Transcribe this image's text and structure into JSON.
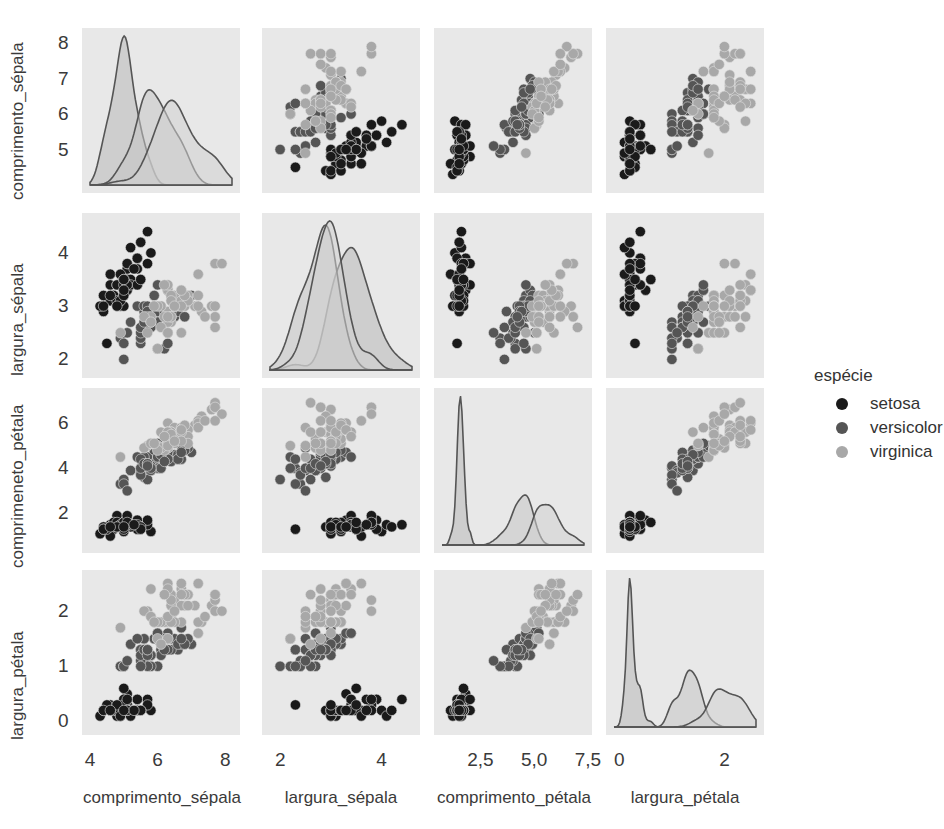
{
  "chart_data": {
    "type": "scatter",
    "kind": "pairplot",
    "title": "",
    "variables": [
      "comprimento_sépala",
      "largura_sépala",
      "comprimeneto_pétala",
      "largura_pétala"
    ],
    "x_axis_labels": [
      "comprimento_sépala",
      "largura_sépala",
      "comprimento_pétala",
      "largura_pétala"
    ],
    "y_axis_labels": [
      "comprimento_sépala",
      "largura_sépala",
      "comprimeneto_pétala",
      "largura_pétala"
    ],
    "diagonal": "kde",
    "offdiagonal": "scatter",
    "hue": "espécie",
    "legend": {
      "title": "espécie",
      "position": "right",
      "entries": [
        {
          "label": "setosa",
          "color": "#1a1a1a"
        },
        {
          "label": "versicolor",
          "color": "#555555"
        },
        {
          "label": "virginica",
          "color": "#a8a8a8"
        }
      ]
    },
    "ranges": {
      "comprimento_sépala": [
        4.0,
        8.2
      ],
      "largura_sépala": [
        1.8,
        4.6
      ],
      "comprimeneto_pétala": [
        0.6,
        7.2
      ],
      "largura_pétala": [
        -0.1,
        2.6
      ]
    },
    "y_ticks": [
      {
        "values": [
          5,
          6,
          7,
          8
        ],
        "labels": [
          "5",
          "6",
          "7",
          "8"
        ]
      },
      {
        "values": [
          2,
          3,
          4
        ],
        "labels": [
          "2",
          "3",
          "4"
        ]
      },
      {
        "values": [
          2,
          4,
          6
        ],
        "labels": [
          "2",
          "4",
          "6"
        ]
      },
      {
        "values": [
          0,
          1,
          2
        ],
        "labels": [
          "0",
          "1",
          "2"
        ]
      }
    ],
    "x_ticks": [
      {
        "values": [
          4,
          6,
          8
        ],
        "labels": [
          "4",
          "6",
          "8"
        ]
      },
      {
        "values": [
          2,
          4
        ],
        "labels": [
          "2",
          "4"
        ]
      },
      {
        "values": [
          2.5,
          5.0,
          7.5
        ],
        "labels": [
          "2,5",
          "5,0",
          "7,5"
        ]
      },
      {
        "values": [
          0,
          2
        ],
        "labels": [
          "0",
          "2"
        ]
      }
    ],
    "grid": false,
    "panel_background": "#e8e8e8",
    "series": [
      {
        "name": "setosa",
        "color": "#1a1a1a",
        "points": [
          [
            5.1,
            3.5,
            1.4,
            0.2
          ],
          [
            4.9,
            3.0,
            1.4,
            0.2
          ],
          [
            4.7,
            3.2,
            1.3,
            0.2
          ],
          [
            4.6,
            3.1,
            1.5,
            0.2
          ],
          [
            5.0,
            3.6,
            1.4,
            0.2
          ],
          [
            5.4,
            3.9,
            1.7,
            0.4
          ],
          [
            4.6,
            3.4,
            1.4,
            0.3
          ],
          [
            5.0,
            3.4,
            1.5,
            0.2
          ],
          [
            4.4,
            2.9,
            1.4,
            0.2
          ],
          [
            4.9,
            3.1,
            1.5,
            0.1
          ],
          [
            5.4,
            3.7,
            1.5,
            0.2
          ],
          [
            4.8,
            3.4,
            1.6,
            0.2
          ],
          [
            4.8,
            3.0,
            1.4,
            0.1
          ],
          [
            4.3,
            3.0,
            1.1,
            0.1
          ],
          [
            5.8,
            4.0,
            1.2,
            0.2
          ],
          [
            5.7,
            4.4,
            1.5,
            0.4
          ],
          [
            5.4,
            3.9,
            1.3,
            0.4
          ],
          [
            5.1,
            3.5,
            1.4,
            0.3
          ],
          [
            5.7,
            3.8,
            1.7,
            0.3
          ],
          [
            5.1,
            3.8,
            1.5,
            0.3
          ],
          [
            5.4,
            3.4,
            1.7,
            0.2
          ],
          [
            5.1,
            3.7,
            1.5,
            0.4
          ],
          [
            4.6,
            3.6,
            1.0,
            0.2
          ],
          [
            5.1,
            3.3,
            1.7,
            0.5
          ],
          [
            4.8,
            3.4,
            1.9,
            0.2
          ],
          [
            5.0,
            3.0,
            1.6,
            0.2
          ],
          [
            5.0,
            3.4,
            1.6,
            0.4
          ],
          [
            5.2,
            3.5,
            1.5,
            0.2
          ],
          [
            5.2,
            3.4,
            1.4,
            0.2
          ],
          [
            4.7,
            3.2,
            1.6,
            0.2
          ],
          [
            4.8,
            3.1,
            1.6,
            0.2
          ],
          [
            5.4,
            3.4,
            1.5,
            0.4
          ],
          [
            5.2,
            4.1,
            1.5,
            0.1
          ],
          [
            5.5,
            4.2,
            1.4,
            0.2
          ],
          [
            4.9,
            3.1,
            1.5,
            0.2
          ],
          [
            5.0,
            3.2,
            1.2,
            0.2
          ],
          [
            5.5,
            3.5,
            1.3,
            0.2
          ],
          [
            4.9,
            3.6,
            1.4,
            0.1
          ],
          [
            4.4,
            3.0,
            1.3,
            0.2
          ],
          [
            5.1,
            3.4,
            1.5,
            0.2
          ],
          [
            5.0,
            3.5,
            1.3,
            0.3
          ],
          [
            4.5,
            2.3,
            1.3,
            0.3
          ],
          [
            4.4,
            3.2,
            1.3,
            0.2
          ],
          [
            5.0,
            3.5,
            1.6,
            0.6
          ],
          [
            5.1,
            3.8,
            1.9,
            0.4
          ],
          [
            4.8,
            3.0,
            1.4,
            0.3
          ],
          [
            5.1,
            3.8,
            1.6,
            0.2
          ],
          [
            4.6,
            3.2,
            1.4,
            0.2
          ],
          [
            5.3,
            3.7,
            1.5,
            0.2
          ],
          [
            5.0,
            3.3,
            1.4,
            0.2
          ]
        ]
      },
      {
        "name": "versicolor",
        "color": "#555555",
        "points": [
          [
            7.0,
            3.2,
            4.7,
            1.4
          ],
          [
            6.4,
            3.2,
            4.5,
            1.5
          ],
          [
            6.9,
            3.1,
            4.9,
            1.5
          ],
          [
            5.5,
            2.3,
            4.0,
            1.3
          ],
          [
            6.5,
            2.8,
            4.6,
            1.5
          ],
          [
            5.7,
            2.8,
            4.5,
            1.3
          ],
          [
            6.3,
            3.3,
            4.7,
            1.6
          ],
          [
            4.9,
            2.4,
            3.3,
            1.0
          ],
          [
            6.6,
            2.9,
            4.6,
            1.3
          ],
          [
            5.2,
            2.7,
            3.9,
            1.4
          ],
          [
            5.0,
            2.0,
            3.5,
            1.0
          ],
          [
            5.9,
            3.0,
            4.2,
            1.5
          ],
          [
            6.0,
            2.2,
            4.0,
            1.0
          ],
          [
            6.1,
            2.9,
            4.7,
            1.4
          ],
          [
            5.6,
            2.9,
            3.6,
            1.3
          ],
          [
            6.7,
            3.1,
            4.4,
            1.4
          ],
          [
            5.6,
            3.0,
            4.5,
            1.5
          ],
          [
            5.8,
            2.7,
            4.1,
            1.0
          ],
          [
            6.2,
            2.2,
            4.5,
            1.5
          ],
          [
            5.6,
            2.5,
            3.9,
            1.1
          ],
          [
            5.9,
            3.2,
            4.8,
            1.8
          ],
          [
            6.1,
            2.8,
            4.0,
            1.3
          ],
          [
            6.3,
            2.5,
            4.9,
            1.5
          ],
          [
            6.1,
            2.8,
            4.7,
            1.2
          ],
          [
            6.4,
            2.9,
            4.3,
            1.3
          ],
          [
            6.6,
            3.0,
            4.4,
            1.4
          ],
          [
            6.8,
            2.8,
            4.8,
            1.4
          ],
          [
            6.7,
            3.0,
            5.0,
            1.7
          ],
          [
            6.0,
            2.9,
            4.5,
            1.5
          ],
          [
            5.7,
            2.6,
            3.5,
            1.0
          ],
          [
            5.5,
            2.4,
            3.8,
            1.1
          ],
          [
            5.5,
            2.4,
            3.7,
            1.0
          ],
          [
            5.8,
            2.7,
            3.9,
            1.2
          ],
          [
            6.0,
            2.7,
            5.1,
            1.6
          ],
          [
            5.4,
            3.0,
            4.5,
            1.5
          ],
          [
            6.0,
            3.4,
            4.5,
            1.6
          ],
          [
            6.7,
            3.1,
            4.7,
            1.5
          ],
          [
            6.3,
            2.3,
            4.4,
            1.3
          ],
          [
            5.6,
            3.0,
            4.1,
            1.3
          ],
          [
            5.5,
            2.5,
            4.0,
            1.3
          ],
          [
            5.5,
            2.6,
            4.4,
            1.2
          ],
          [
            6.1,
            3.0,
            4.6,
            1.4
          ],
          [
            5.8,
            2.6,
            4.0,
            1.2
          ],
          [
            5.0,
            2.3,
            3.3,
            1.0
          ],
          [
            5.6,
            2.7,
            4.2,
            1.3
          ],
          [
            5.7,
            3.0,
            4.2,
            1.2
          ],
          [
            5.7,
            2.9,
            4.2,
            1.3
          ],
          [
            6.2,
            2.9,
            4.3,
            1.3
          ],
          [
            5.1,
            2.5,
            3.0,
            1.1
          ],
          [
            5.7,
            2.8,
            4.1,
            1.3
          ]
        ]
      },
      {
        "name": "virginica",
        "color": "#a8a8a8",
        "points": [
          [
            6.3,
            3.3,
            6.0,
            2.5
          ],
          [
            5.8,
            2.7,
            5.1,
            1.9
          ],
          [
            7.1,
            3.0,
            5.9,
            2.1
          ],
          [
            6.3,
            2.9,
            5.6,
            1.8
          ],
          [
            6.5,
            3.0,
            5.8,
            2.2
          ],
          [
            7.6,
            3.0,
            6.6,
            2.1
          ],
          [
            4.9,
            2.5,
            4.5,
            1.7
          ],
          [
            7.3,
            2.9,
            6.3,
            1.8
          ],
          [
            6.7,
            2.5,
            5.8,
            1.8
          ],
          [
            7.2,
            3.6,
            6.1,
            2.5
          ],
          [
            6.5,
            3.2,
            5.1,
            2.0
          ],
          [
            6.4,
            2.7,
            5.3,
            1.9
          ],
          [
            6.8,
            3.0,
            5.5,
            2.1
          ],
          [
            5.7,
            2.5,
            5.0,
            2.0
          ],
          [
            5.8,
            2.8,
            5.1,
            2.4
          ],
          [
            6.4,
            3.2,
            5.3,
            2.3
          ],
          [
            6.5,
            3.0,
            5.5,
            1.8
          ],
          [
            7.7,
            3.8,
            6.7,
            2.2
          ],
          [
            7.7,
            2.6,
            6.9,
            2.3
          ],
          [
            6.0,
            2.2,
            5.0,
            1.5
          ],
          [
            6.9,
            3.2,
            5.7,
            2.3
          ],
          [
            5.6,
            2.8,
            4.9,
            2.0
          ],
          [
            7.7,
            2.8,
            6.7,
            2.0
          ],
          [
            6.3,
            2.7,
            4.9,
            1.8
          ],
          [
            6.7,
            3.3,
            5.7,
            2.1
          ],
          [
            7.2,
            3.2,
            6.0,
            1.8
          ],
          [
            6.2,
            2.8,
            4.8,
            1.8
          ],
          [
            6.1,
            3.0,
            4.9,
            1.8
          ],
          [
            6.4,
            2.8,
            5.6,
            2.1
          ],
          [
            7.2,
            3.0,
            5.8,
            1.6
          ],
          [
            7.4,
            2.8,
            6.1,
            1.9
          ],
          [
            7.9,
            3.8,
            6.4,
            2.0
          ],
          [
            6.4,
            2.8,
            5.6,
            2.2
          ],
          [
            6.3,
            2.8,
            5.1,
            1.5
          ],
          [
            6.1,
            2.6,
            5.6,
            1.4
          ],
          [
            7.7,
            3.0,
            6.1,
            2.3
          ],
          [
            6.3,
            3.4,
            5.6,
            2.4
          ],
          [
            6.4,
            3.1,
            5.5,
            1.8
          ],
          [
            6.0,
            3.0,
            4.8,
            1.8
          ],
          [
            6.9,
            3.1,
            5.4,
            2.1
          ],
          [
            6.7,
            3.1,
            5.6,
            2.4
          ],
          [
            6.9,
            3.1,
            5.1,
            2.3
          ],
          [
            5.8,
            2.7,
            5.1,
            1.9
          ],
          [
            6.8,
            3.2,
            5.9,
            2.3
          ],
          [
            6.7,
            3.3,
            5.7,
            2.5
          ],
          [
            6.7,
            3.0,
            5.2,
            2.3
          ],
          [
            6.3,
            2.5,
            5.0,
            1.9
          ],
          [
            6.5,
            3.0,
            5.2,
            2.0
          ],
          [
            6.2,
            3.4,
            5.4,
            2.3
          ],
          [
            5.9,
            3.0,
            5.1,
            1.8
          ]
        ]
      }
    ]
  },
  "layout": {
    "left": [
      82,
      262,
      434,
      606
    ],
    "top": [
      28,
      213,
      388,
      570
    ],
    "width": 158,
    "height": 165
  }
}
